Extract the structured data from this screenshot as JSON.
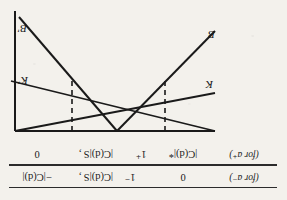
{
  "figure": {
    "orientation": "rotated-180",
    "ink_color": "#1a1a1a",
    "paper_color": "#f3f1ec"
  },
  "scale": {
    "rows": [
      {
        "id": "upper",
        "side_label": "(for a⁻)",
        "cells": [
          "0",
          "",
          "|C(d)|S ,",
          "−|C(d)|"
        ]
      },
      {
        "id": "lower",
        "side_label": "(for a⁺)",
        "cells": [
          "|C(d)|*",
          "1⁺",
          "|C(d)|S ,",
          "0"
        ]
      }
    ],
    "tick_marks": [
      "1⁻"
    ]
  },
  "graph": {
    "lines": [
      {
        "name": "K",
        "label": "K",
        "from": [
          62,
          12
        ],
        "to": [
          268,
          62
        ]
      },
      {
        "name": "Kp",
        "label": "K'",
        "from": [
          62,
          50
        ],
        "to": [
          262,
          12
        ]
      },
      {
        "name": "B",
        "label": "B",
        "from": [
          62,
          112
        ],
        "to": [
          202,
          12
        ]
      },
      {
        "name": "Bp",
        "label": "B'",
        "from": [
          150,
          12
        ],
        "to": [
          258,
          122
        ]
      }
    ],
    "axes": {
      "top_rule": {
        "y": 12,
        "x1": 62,
        "x2": 262
      },
      "right_rule": {
        "x": 262,
        "y1": 12,
        "y2": 132
      }
    },
    "dashed_guides": [
      {
        "name": "left-guide",
        "x": 112,
        "y1": 12,
        "y2": 66
      },
      {
        "name": "right-guide",
        "x": 205,
        "y1": 12,
        "y2": 66
      }
    ],
    "intersections": [
      {
        "name": "left-node",
        "x": 112,
        "y": 66
      },
      {
        "name": "right-node",
        "x": 205,
        "y": 66
      }
    ],
    "labels": {
      "K": "K",
      "K_prime": "K'",
      "B": "B",
      "B_prime": "B'"
    }
  }
}
